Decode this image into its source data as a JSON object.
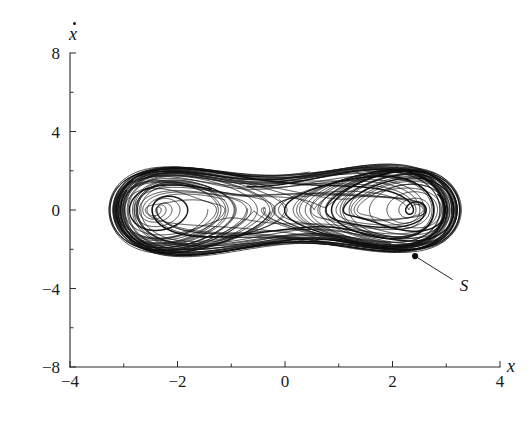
{
  "figure": {
    "name": "duffing-strange-attractor-phase-portrait",
    "background_color": "#ffffff",
    "line_color": "#111111"
  },
  "annotations": [
    {
      "label": "S",
      "name": "annotation-s",
      "x": 2.42,
      "y": -2.35,
      "label_x": 3.12,
      "label_y": -3.55
    }
  ],
  "chart_data": {
    "type": "line",
    "title": "",
    "subtitle": "",
    "xlabel": "x",
    "ylabel": "ẋ",
    "xlim": [
      -4,
      4
    ],
    "ylim": [
      -8,
      8
    ],
    "xticks": [
      -4,
      -2,
      0,
      2,
      4
    ],
    "yticks": [
      -8,
      -4,
      0,
      4,
      8
    ],
    "xticklabels": [
      "-4",
      "-2",
      "0",
      "2",
      "4"
    ],
    "yticklabels": [
      "-8",
      "-4",
      "0",
      "4",
      "8"
    ],
    "xminorticks": [
      -3,
      -1,
      1,
      3
    ],
    "yminorticks": [
      -6,
      -2,
      2,
      6
    ],
    "grid": false,
    "legend": null,
    "legend_position": "none",
    "series": [
      {
        "name": "attractor-trajectory",
        "color": "#111111",
        "x": [],
        "y": []
      }
    ],
    "attractor": {
      "foci": [
        {
          "x": -1.55,
          "y": 0.0
        },
        {
          "x": 1.55,
          "y": 0.0
        }
      ],
      "saddle": {
        "x": 0.0,
        "y": 0.0
      },
      "x_extent": [
        -3.35,
        3.35
      ],
      "y_extent": [
        -6.4,
        6.4
      ]
    }
  }
}
